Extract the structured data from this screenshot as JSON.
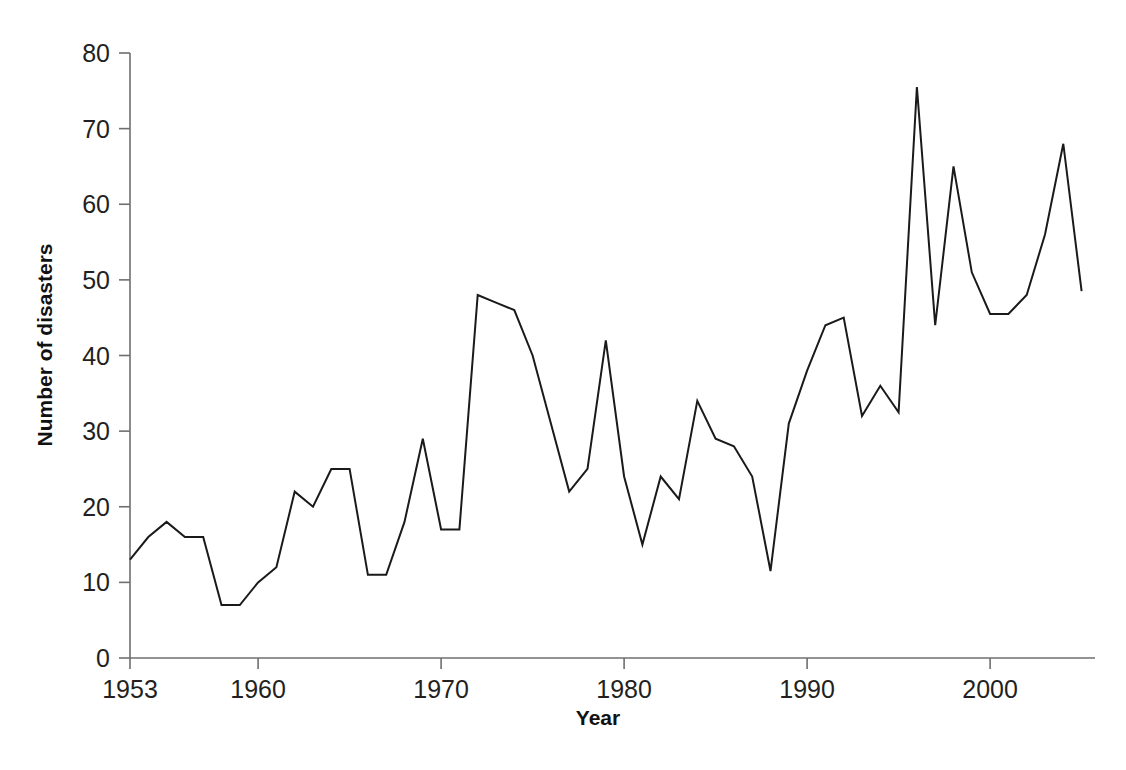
{
  "chart_data": {
    "type": "line",
    "title": "",
    "xlabel": "Year",
    "ylabel": "Number of disasters",
    "xlim": [
      1953,
      2005
    ],
    "ylim": [
      0,
      80
    ],
    "grid": false,
    "legend": "none",
    "x_ticks": [
      1953,
      1960,
      1970,
      1980,
      1990,
      2000
    ],
    "x_tick_labels": [
      "1953",
      "1960",
      "1970",
      "1980",
      "1990",
      "2000"
    ],
    "y_ticks": [
      0,
      10,
      20,
      30,
      40,
      50,
      60,
      70,
      80
    ],
    "y_tick_labels": [
      "0",
      "10",
      "20",
      "30",
      "40",
      "50",
      "60",
      "70",
      "80"
    ],
    "series": [
      {
        "name": "Number of disasters",
        "color": "#1a1a1a",
        "x": [
          1953,
          1954,
          1955,
          1956,
          1957,
          1958,
          1959,
          1960,
          1961,
          1962,
          1963,
          1964,
          1965,
          1966,
          1967,
          1968,
          1969,
          1970,
          1971,
          1972,
          1973,
          1974,
          1975,
          1976,
          1977,
          1978,
          1979,
          1980,
          1981,
          1982,
          1983,
          1984,
          1985,
          1986,
          1987,
          1988,
          1989,
          1990,
          1991,
          1992,
          1993,
          1994,
          1995,
          1996,
          1997,
          1998,
          1999,
          2000,
          2001,
          2002,
          2003,
          2004,
          2005
        ],
        "values": [
          13,
          16,
          18,
          16,
          16,
          7,
          7,
          10,
          12,
          22,
          20,
          25,
          25,
          11,
          11,
          18,
          29,
          17,
          17,
          48,
          47,
          46,
          40,
          31,
          22,
          25,
          42,
          24,
          15,
          24,
          21,
          34,
          29,
          28,
          24,
          11.5,
          31,
          38,
          44,
          45,
          32,
          36,
          32.5,
          75.5,
          44,
          65,
          51,
          45.5,
          45.5,
          48,
          56,
          68,
          48.5
        ]
      }
    ]
  }
}
